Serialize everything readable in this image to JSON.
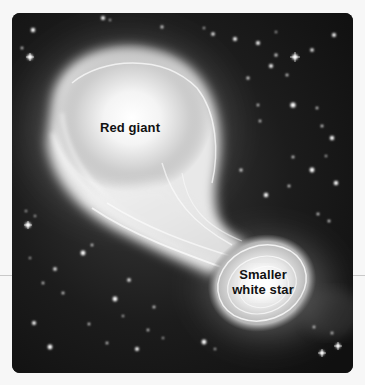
{
  "figure": {
    "background_color": "#151515",
    "page_color": "#f7f7f7",
    "labels": {
      "red_giant": "Red giant",
      "white_star_line1": "Smaller",
      "white_star_line2": "white star"
    },
    "icons": {
      "red_giant": "red-giant-star-icon",
      "white_star": "white-dwarf-star-icon",
      "stream": "mass-transfer-stream-icon",
      "background_stars": "starfield-icon"
    }
  }
}
